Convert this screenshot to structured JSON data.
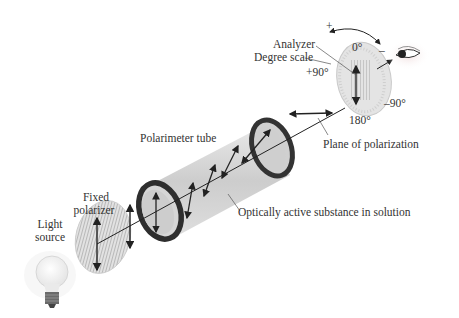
{
  "diagram": {
    "labels": {
      "analyzer": "Analyzer",
      "degree_scale": "Degree scale",
      "deg_0": "0°",
      "deg_plus90": "+90°",
      "deg_minus90": "–90°",
      "deg_180": "180°",
      "plus_sign": "+",
      "minus_sign": "–",
      "plane_of_polarization": "Plane of polarization",
      "polarimeter_tube": "Polarimeter tube",
      "optically_active": "Optically active substance in solution",
      "fixed_polarizer_1": "Fixed",
      "fixed_polarizer_2": "polarizer",
      "light_source_1": "Light",
      "light_source_2": "source"
    },
    "colors": {
      "line": "#222222",
      "tube": "#c8c8c8",
      "ring": "#3a3a3a",
      "disk": "#dcdcdc",
      "text": "#333333"
    }
  }
}
